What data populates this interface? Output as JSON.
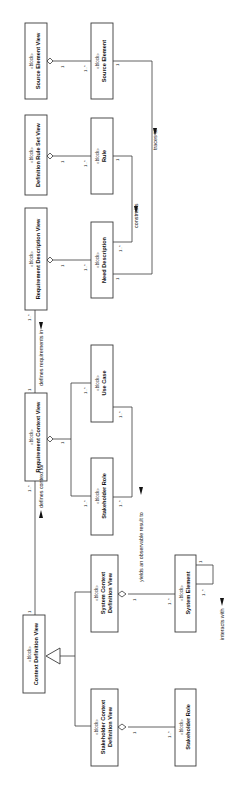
{
  "diagram": {
    "stereotype": "«block»",
    "blocks": [
      {
        "id": "source-element-view",
        "name": "Source Element View"
      },
      {
        "id": "source-element",
        "name": "Source Element"
      },
      {
        "id": "definition-rule-set-view",
        "name": "Definition Rule Set View"
      },
      {
        "id": "rule",
        "name": "Rule"
      },
      {
        "id": "requirement-description-view",
        "name": "Requirement Description View"
      },
      {
        "id": "need-description",
        "name": "Need Description"
      },
      {
        "id": "requirement-context-view",
        "name": "Requirement Context View"
      },
      {
        "id": "use-case",
        "name": "Use Case"
      },
      {
        "id": "stakeholder-role-1",
        "name": "Stakeholder Role"
      },
      {
        "id": "context-definition-view",
        "name": "Context Definition View"
      },
      {
        "id": "system-context-definition-view",
        "name_line1": "System Context",
        "name_line2": "Definition View"
      },
      {
        "id": "system-element",
        "name": "System Element"
      },
      {
        "id": "stakeholder-context-definition-view",
        "name_line1": "Stakeholder Context",
        "name_line2": "Definition View"
      },
      {
        "id": "stakeholder-role-2",
        "name": "Stakeholder Role"
      }
    ],
    "associations": {
      "traces_to": "traces to",
      "constrains": "constrains",
      "defines_requirements_in": "defines requirements in",
      "yields_result": "yields an observable result to",
      "defines_context_for": "defines context for",
      "interacts_with": "interacts with"
    },
    "multiplicities": {
      "one": "1",
      "one_many": "1..*"
    }
  }
}
